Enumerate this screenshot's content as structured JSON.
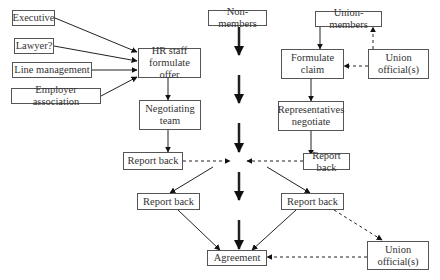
{
  "diagram": {
    "type": "flowchart",
    "title": "",
    "nodes": {
      "executive": "Executive",
      "lawyer": "Lawyer?",
      "line_management": "Line management",
      "employer_association": "Employer association",
      "hr_staff": "HR staff\nformulate offer",
      "negotiating_team": "Negotiating\nteam",
      "report_back_left_1": "Report back",
      "report_back_left_2": "Report back",
      "non_members": "Non-members",
      "agreement": "Agreement",
      "union_members": "Union-members",
      "formulate_claim": "Formulate\nclaim",
      "union_officials_top": "Union\nofficial(s)",
      "representatives": "Representatives\nnegotiate",
      "report_back_right_1": "Report back",
      "report_back_right_2": "Report back",
      "union_officials_bottom": "Union\nofficial(s)"
    },
    "edges": [
      {
        "from": "Executive",
        "to": "HR staff formulate offer",
        "style": "solid"
      },
      {
        "from": "Lawyer?",
        "to": "HR staff formulate offer",
        "style": "solid"
      },
      {
        "from": "Line management",
        "to": "HR staff formulate offer",
        "style": "solid"
      },
      {
        "from": "Employer association",
        "to": "HR staff formulate offer",
        "style": "solid"
      },
      {
        "from": "HR staff formulate offer",
        "to": "Negotiating team",
        "style": "solid"
      },
      {
        "from": "Negotiating team",
        "to": "Report back (left)",
        "style": "solid"
      },
      {
        "from": "Report back (left)",
        "to": "center",
        "style": "dashed"
      },
      {
        "from": "center",
        "to": "Report back (left lower)",
        "style": "solid"
      },
      {
        "from": "Report back (left lower)",
        "to": "Agreement",
        "style": "solid"
      },
      {
        "from": "Non-members",
        "to": "Agreement",
        "style": "thick-segmented"
      },
      {
        "from": "Union-members",
        "to": "Formulate claim",
        "style": "solid"
      },
      {
        "from": "Union official(s)",
        "to": "Union-members",
        "style": "dashed"
      },
      {
        "from": "Union official(s)",
        "to": "Formulate claim",
        "style": "dashed"
      },
      {
        "from": "Formulate claim",
        "to": "Representatives negotiate",
        "style": "solid"
      },
      {
        "from": "Representatives negotiate",
        "to": "Report back (right)",
        "style": "solid"
      },
      {
        "from": "Report back (right)",
        "to": "center",
        "style": "dashed"
      },
      {
        "from": "center",
        "to": "Report back (right lower)",
        "style": "solid"
      },
      {
        "from": "Report back (right lower)",
        "to": "Agreement",
        "style": "solid"
      },
      {
        "from": "Report back (right lower)",
        "to": "Union official(s) (bottom)",
        "style": "dashed"
      },
      {
        "from": "Union official(s) (bottom)",
        "to": "Agreement",
        "style": "dashed"
      }
    ],
    "colors": {
      "line": "#222222",
      "border": "#555555",
      "background": "#ffffff"
    }
  }
}
